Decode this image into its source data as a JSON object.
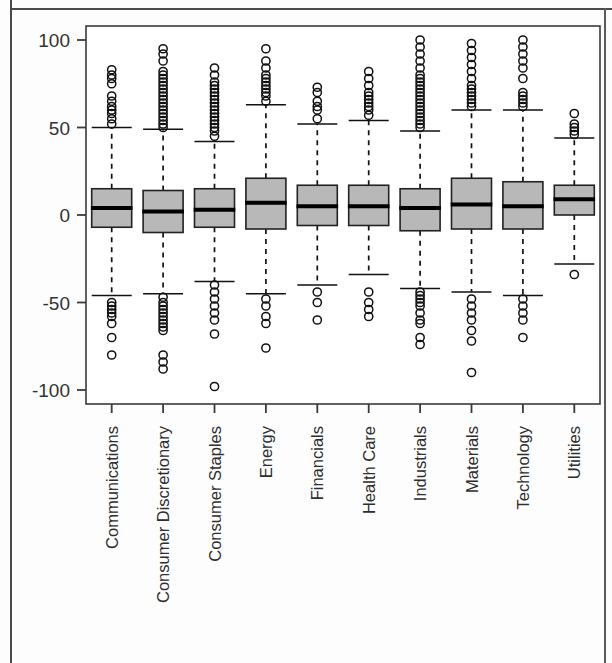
{
  "chart_data": {
    "type": "boxplot",
    "title": "",
    "xlabel": "",
    "ylabel": "",
    "ylim": [
      -108,
      108
    ],
    "yticks": [
      100,
      50,
      0,
      -50,
      -100
    ],
    "ytick_labels": [
      "100",
      "50",
      "0",
      "-50",
      "-100"
    ],
    "grid": false,
    "legend": null,
    "box_fill_color": "#b8b8b8",
    "box_edge_color": "#222222",
    "median_color": "#000000",
    "whisker_style": "dashed",
    "outlier_marker": "open-circle",
    "categories": [
      "Communications",
      "Consumer Discretionary",
      "Consumer Staples",
      "Energy",
      "Financials",
      "Health Care",
      "Industrials",
      "Materials",
      "Technology",
      "Utilities"
    ],
    "boxes": [
      {
        "label": "Communications",
        "q1": -7,
        "median": 4,
        "q3": 15,
        "whisker_low": -46,
        "whisker_high": 50,
        "outliers_high": [
          52,
          55,
          58,
          60,
          62,
          65,
          68,
          75,
          78,
          80,
          83
        ],
        "outliers_low": [
          -50,
          -52,
          -54,
          -56,
          -58,
          -62,
          -70,
          -80
        ]
      },
      {
        "label": "Consumer Discretionary",
        "q1": -10,
        "median": 2,
        "q3": 14,
        "whisker_low": -45,
        "whisker_high": 49,
        "outliers_high": [
          50,
          52,
          54,
          56,
          58,
          60,
          62,
          64,
          66,
          68,
          70,
          72,
          74,
          76,
          78,
          80,
          82,
          88,
          92,
          95
        ],
        "outliers_low": [
          -47,
          -50,
          -52,
          -54,
          -56,
          -58,
          -60,
          -62,
          -64,
          -66,
          -80,
          -84,
          -88
        ]
      },
      {
        "label": "Consumer Staples",
        "q1": -7,
        "median": 3,
        "q3": 15,
        "whisker_low": -38,
        "whisker_high": 42,
        "outliers_high": [
          45,
          48,
          50,
          52,
          54,
          56,
          58,
          60,
          62,
          64,
          66,
          68,
          70,
          72,
          74,
          76,
          80,
          84
        ],
        "outliers_low": [
          -40,
          -44,
          -48,
          -52,
          -56,
          -60,
          -68,
          -98
        ]
      },
      {
        "label": "Energy",
        "q1": -8,
        "median": 7,
        "q3": 21,
        "whisker_low": -45,
        "whisker_high": 63,
        "outliers_high": [
          65,
          68,
          70,
          72,
          74,
          76,
          78,
          80,
          84,
          88,
          95
        ],
        "outliers_low": [
          -48,
          -52,
          -58,
          -62,
          -76
        ]
      },
      {
        "label": "Financials",
        "q1": -6,
        "median": 5,
        "q3": 17,
        "whisker_low": -40,
        "whisker_high": 52,
        "outliers_high": [
          55,
          60,
          62,
          65,
          70,
          73
        ],
        "outliers_low": [
          -44,
          -50,
          -60
        ]
      },
      {
        "label": "Health Care",
        "q1": -6,
        "median": 5,
        "q3": 17,
        "whisker_low": -34,
        "whisker_high": 54,
        "outliers_high": [
          57,
          60,
          62,
          64,
          66,
          68,
          70,
          74,
          78,
          82
        ],
        "outliers_low": [
          -44,
          -50,
          -54,
          -58
        ]
      },
      {
        "label": "Industrials",
        "q1": -9,
        "median": 4,
        "q3": 15,
        "whisker_low": -42,
        "whisker_high": 48,
        "outliers_high": [
          50,
          52,
          54,
          56,
          58,
          60,
          62,
          64,
          66,
          68,
          70,
          72,
          74,
          76,
          78,
          80,
          84,
          88,
          92,
          96,
          100
        ],
        "outliers_low": [
          -44,
          -46,
          -48,
          -50,
          -52,
          -56,
          -60,
          -62,
          -70,
          -74
        ]
      },
      {
        "label": "Materials",
        "q1": -8,
        "median": 6,
        "q3": 21,
        "whisker_low": -44,
        "whisker_high": 60,
        "outliers_high": [
          62,
          64,
          66,
          68,
          70,
          72,
          74,
          78,
          82,
          86,
          90,
          94,
          98
        ],
        "outliers_low": [
          -48,
          -52,
          -56,
          -60,
          -66,
          -72,
          -90
        ]
      },
      {
        "label": "Technology",
        "q1": -8,
        "median": 5,
        "q3": 19,
        "whisker_low": -46,
        "whisker_high": 60,
        "outliers_high": [
          62,
          64,
          66,
          68,
          70,
          78,
          84,
          88,
          92,
          96,
          100
        ],
        "outliers_low": [
          -48,
          -52,
          -56,
          -60,
          -70
        ]
      },
      {
        "label": "Utilities",
        "q1": 0,
        "median": 9,
        "q3": 17,
        "whisker_low": -28,
        "whisker_high": 44,
        "outliers_high": [
          46,
          48,
          50,
          52,
          58
        ],
        "outliers_low": [
          -34
        ]
      }
    ]
  }
}
